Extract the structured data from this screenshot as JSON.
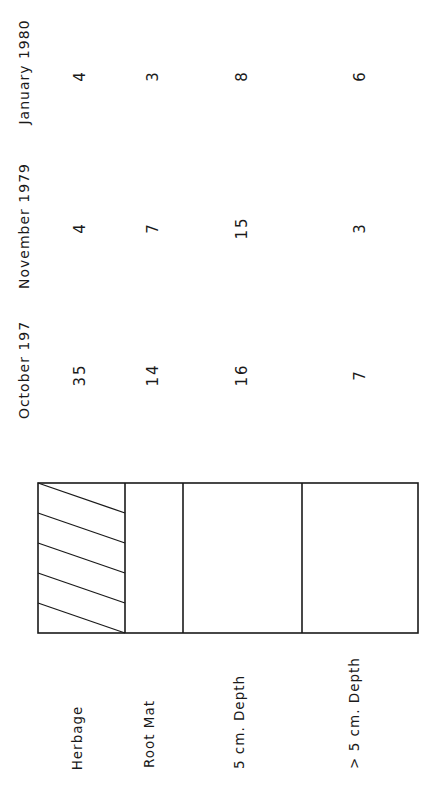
{
  "table": {
    "columns": [
      {
        "label": "January 1980",
        "center_y": 72
      },
      {
        "label": "November 1979",
        "center_y": 226
      },
      {
        "label": "October 197",
        "center_y": 370
      }
    ],
    "rows": [
      {
        "layer": "Herbage",
        "values": {
          "jan_1980": "4",
          "nov_1979": "4",
          "oct_197": "35"
        }
      },
      {
        "layer": "Root Mat",
        "values": {
          "jan_1980": "3",
          "nov_1979": "7",
          "oct_197": "14"
        }
      },
      {
        "layer": "5 cm.  Depth",
        "values": {
          "jan_1980": "8",
          "nov_1979": "15",
          "oct_197": "16"
        }
      },
      {
        "layer": "> 5 cm.  Depth",
        "values": {
          "jan_1980": "6",
          "nov_1979": "3",
          "oct_197": "7"
        }
      }
    ]
  },
  "profile_diagram": {
    "segments": [
      "Herbage",
      "Root Mat",
      "5 cm. Depth",
      "> 5 cm. Depth"
    ],
    "hatched_segment": "Herbage",
    "line_color": "#1a1a1a"
  }
}
